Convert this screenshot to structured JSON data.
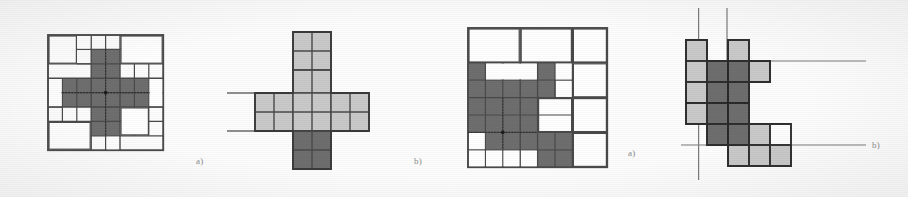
{
  "figure": {
    "caption_labels": [
      "a)",
      "b)",
      "a)",
      "b)"
    ],
    "colors": {
      "paper": "#fdfdfd",
      "ink": "#3a3a3a",
      "line": "#4a4a4a",
      "empty_cell": "#ffffff",
      "light_fill": "#c9c9c9",
      "dark_fill": "#6e6e6e",
      "label_text": "#8a8a8a"
    },
    "panels": [
      {
        "id": "panel-1",
        "label": "a)",
        "label_x": 196,
        "label_y": 163,
        "type": "grid-quadtree-cross",
        "origin_x": 48,
        "origin_y": 35,
        "cell": 14.4,
        "cols": 8,
        "rows": 8,
        "description": "8x8 quadtree-decomposed square with a shaded plus/cross region in the centre",
        "filled_cells": [
          [
            3,
            1
          ],
          [
            4,
            1
          ],
          [
            3,
            2
          ],
          [
            4,
            2
          ],
          [
            1,
            3
          ],
          [
            2,
            3
          ],
          [
            3,
            3
          ],
          [
            4,
            3
          ],
          [
            5,
            3
          ],
          [
            6,
            3
          ],
          [
            1,
            4
          ],
          [
            2,
            4
          ],
          [
            3,
            4
          ],
          [
            4,
            4
          ],
          [
            5,
            4
          ],
          [
            6,
            4
          ],
          [
            3,
            5
          ],
          [
            4,
            5
          ],
          [
            3,
            6
          ],
          [
            4,
            6
          ]
        ],
        "quad_lines": {
          "verticals": [
            0,
            1,
            2,
            3,
            4,
            5,
            6,
            7,
            8
          ],
          "horizontals": [
            0,
            1,
            2,
            3,
            4,
            5,
            6,
            7,
            8
          ]
        }
      },
      {
        "id": "panel-2",
        "label": "b)",
        "label_x": 414,
        "label_y": 163,
        "type": "cross-with-axes",
        "origin_x": 255,
        "origin_y": 32,
        "cell": 19,
        "description": "Plus-shaped polyomino of light grey cells with a dark grey foot, two horizontal rules crossing on the left",
        "light_cells": [
          [
            2,
            0
          ],
          [
            3,
            0
          ],
          [
            2,
            1
          ],
          [
            3,
            1
          ],
          [
            0,
            2
          ],
          [
            1,
            2
          ],
          [
            2,
            2
          ],
          [
            3,
            2
          ],
          [
            4,
            2
          ],
          [
            5,
            2
          ],
          [
            0,
            3
          ],
          [
            1,
            3
          ],
          [
            2,
            3
          ],
          [
            3,
            3
          ],
          [
            4,
            3
          ],
          [
            5,
            3
          ]
        ],
        "dark_cells": [
          [
            2,
            4
          ],
          [
            3,
            4
          ],
          [
            2,
            5
          ],
          [
            3,
            5
          ]
        ],
        "rules": [
          {
            "orientation": "horizontal",
            "y_row": 2,
            "x_from": -2.6,
            "x_to": 0
          },
          {
            "orientation": "horizontal",
            "y_row": 4,
            "x_from": -2.6,
            "x_to": 0
          }
        ]
      },
      {
        "id": "panel-3",
        "label": "a)",
        "label_x": 628,
        "label_y": 156,
        "type": "grid-quadtree-region",
        "origin_x": 468,
        "origin_y": 28,
        "cell": 17.4,
        "cols": 8,
        "rows": 8,
        "description": "8x8 quadtree-decomposed square with an irregular shaded region resembling a blocky letter",
        "filled_cells": [
          [
            0,
            2
          ],
          [
            4,
            2
          ],
          [
            0,
            3
          ],
          [
            1,
            3
          ],
          [
            2,
            3
          ],
          [
            3,
            3
          ],
          [
            4,
            3
          ],
          [
            0,
            4
          ],
          [
            1,
            4
          ],
          [
            2,
            4
          ],
          [
            3,
            4
          ],
          [
            0,
            5
          ],
          [
            1,
            5
          ],
          [
            2,
            5
          ],
          [
            3,
            5
          ],
          [
            1,
            6
          ],
          [
            2,
            6
          ],
          [
            3,
            6
          ],
          [
            4,
            6
          ],
          [
            5,
            6
          ],
          [
            4,
            7
          ],
          [
            5,
            7
          ],
          [
            6,
            7
          ]
        ]
      },
      {
        "id": "panel-4",
        "label": "b)",
        "label_x": 872,
        "label_y": 148,
        "type": "polyomino-with-axes",
        "origin_x": 686,
        "origin_y": 40,
        "cell": 21,
        "description": "Irregular polyomino of light and dark grey cells with two vertical and two horizontal rules crossing it",
        "light_cells": [
          [
            0,
            0
          ],
          [
            2,
            0
          ],
          [
            0,
            1
          ],
          [
            3,
            1
          ],
          [
            0,
            2
          ],
          [
            0,
            3
          ],
          [
            3,
            4
          ],
          [
            4,
            4
          ],
          [
            3,
            5
          ],
          [
            4,
            5
          ],
          [
            5,
            5
          ]
        ],
        "dark_cells": [
          [
            1,
            1
          ],
          [
            2,
            1
          ],
          [
            1,
            2
          ],
          [
            2,
            2
          ],
          [
            1,
            3
          ],
          [
            2,
            3
          ],
          [
            1,
            4
          ],
          [
            2,
            4
          ]
        ],
        "rules": [
          {
            "orientation": "vertical",
            "x_col": 0.6,
            "y_from": -1.5,
            "y_to": 5.6
          },
          {
            "orientation": "vertical",
            "x_col": 2.0,
            "y_from": -1.5,
            "y_to": 1.0
          },
          {
            "orientation": "horizontal",
            "y_row": 1.0,
            "x_from": 3.2,
            "x_to": 8.4
          },
          {
            "orientation": "horizontal",
            "y_row": 4.45,
            "x_from": -1.2,
            "x_to": 8.4
          }
        ]
      }
    ]
  }
}
